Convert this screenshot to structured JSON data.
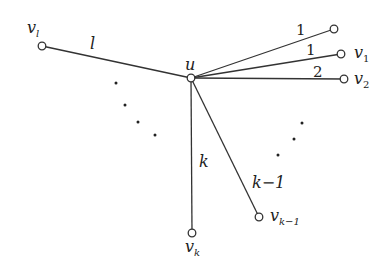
{
  "diagram": {
    "type": "star-graph",
    "center": {
      "id": "u",
      "label": "u",
      "x": 191,
      "y": 78
    },
    "nodes": [
      {
        "id": "v_l",
        "label": "v",
        "sub": "l",
        "x": 42,
        "y": 46
      },
      {
        "id": "top",
        "label": "",
        "sub": "",
        "x": 334,
        "y": 29
      },
      {
        "id": "v_1",
        "label": "v",
        "sub": "1",
        "x": 341,
        "y": 54
      },
      {
        "id": "v_2",
        "label": "v",
        "sub": "2",
        "x": 344,
        "y": 79
      },
      {
        "id": "v_k1",
        "label": "v",
        "sub": "k−1",
        "x": 259,
        "y": 217
      },
      {
        "id": "v_k",
        "label": "v",
        "sub": "k",
        "x": 192,
        "y": 233
      }
    ],
    "edges": [
      {
        "to": "v_l",
        "weight": "l"
      },
      {
        "to": "top",
        "weight": "1"
      },
      {
        "to": "v_1",
        "weight": "1"
      },
      {
        "to": "v_2",
        "weight": "2"
      },
      {
        "to": "v_k1",
        "weight": "k−1"
      },
      {
        "to": "v_k",
        "weight": "k"
      }
    ],
    "ellipsis_left": "· · · ·",
    "ellipsis_right": "· · ·"
  }
}
